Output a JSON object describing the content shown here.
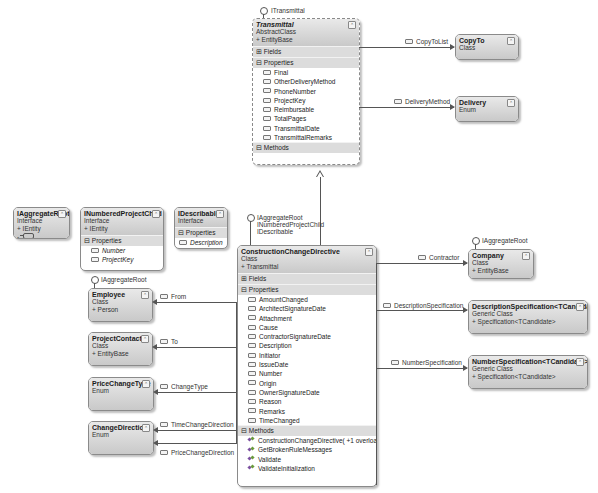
{
  "diagram": {
    "transmittal": {
      "interface_label": "ITransmittal",
      "name": "Transmittal",
      "kind": "AbstractClass",
      "base": "+ EntityBase",
      "fields_label": "Fields",
      "properties_label": "Properties",
      "properties": [
        "Final",
        "OtherDeliveryMethod",
        "PhoneNumber",
        "ProjectKey",
        "Reimbursable",
        "TotalPages",
        "TransmittalDate",
        "TransmittalRemarks"
      ],
      "methods_label": "Methods"
    },
    "copyto": {
      "name": "CopyTo",
      "kind": "Class",
      "assoc_label": "CopyToList"
    },
    "delivery": {
      "name": "Delivery",
      "kind": "Enum",
      "assoc_label": "DeliveryMethod"
    },
    "iaggregateroot": {
      "name": "IAggregateRoot",
      "kind": "Interface",
      "base": "+ IEntity"
    },
    "inumberedprojectchild": {
      "name": "INumberedProjectChild",
      "kind": "Interface",
      "base": "+ IEntity",
      "properties_label": "Properties",
      "properties": [
        "Number",
        "ProjectKey"
      ]
    },
    "idescribable": {
      "name": "IDescribable",
      "kind": "Interface",
      "properties_label": "Properties",
      "properties": [
        "Description"
      ]
    },
    "ccd": {
      "interface_labels": [
        "IAggregateRoot",
        "INumberedProjectChild",
        "IDescribable"
      ],
      "name": "ConstructionChangeDirective",
      "kind": "Class",
      "base": "+ Transmittal",
      "fields_label": "Fields",
      "properties_label": "Properties",
      "properties": [
        "AmountChanged",
        "ArchitectSignatureDate",
        "Attachment",
        "Cause",
        "ContractorSignatureDate",
        "Description",
        "Initiator",
        "IssueDate",
        "Number",
        "Origin",
        "OwnerSignatureDate",
        "Reason",
        "Remarks",
        "TimeChanged"
      ],
      "methods_label": "Methods",
      "methods": [
        "ConstructionChangeDirective( +1 overload)",
        "GetBrokenRuleMessages",
        "Validate",
        "ValidateInitialization"
      ]
    },
    "employee": {
      "interface_label": "IAggregateRoot",
      "name": "Employee",
      "kind": "Class",
      "base": "+ Person",
      "assoc_label": "From"
    },
    "projectcontact": {
      "name": "ProjectContact",
      "kind": "Class",
      "base": "+ EntityBase",
      "assoc_label": "To"
    },
    "pricechangetype": {
      "name": "PriceChangeType",
      "kind": "Enum",
      "assoc_label": "ChangeType"
    },
    "changedirection": {
      "name": "ChangeDirection",
      "kind": "Enum",
      "assoc_labels": [
        "TimeChangeDirection",
        "PriceChangeDirection"
      ]
    },
    "company": {
      "interface_label": "IAggregateRoot",
      "name": "Company",
      "kind": "Class",
      "base": "+ EntityBase",
      "assoc_label": "Contractor"
    },
    "descspec": {
      "name": "DescriptionSpecification<TCandidate>",
      "kind": "Generic Class",
      "base": "+ Specification<TCandidate>",
      "assoc_label": "DescriptionSpecification"
    },
    "numspec": {
      "name": "NumberSpecification<TCandidate>",
      "kind": "Generic Class",
      "base": "+ Specification<TCandidate>",
      "assoc_label": "NumberSpecification"
    },
    "collapse_glyph": "⌃"
  }
}
